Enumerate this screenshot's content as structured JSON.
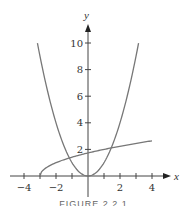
{
  "chart_data": {
    "type": "line",
    "title": "",
    "xlabel": "x",
    "ylabel": "y",
    "xlim": [
      -4.5,
      5
    ],
    "ylim": [
      0,
      11.5
    ],
    "x_ticks": [
      -4,
      -3,
      -2,
      -1,
      1,
      2,
      3,
      4
    ],
    "x_tick_labels": [
      "-4",
      "-2",
      "2",
      "4"
    ],
    "x_tick_label_values": [
      -4,
      -2,
      2,
      4
    ],
    "y_ticks": [
      2,
      4,
      6,
      8,
      10
    ],
    "y_tick_labels": [
      "2",
      "4",
      "6",
      "8",
      "10"
    ],
    "grid": false,
    "legend": null,
    "series": [
      {
        "name": "y = x^2",
        "domain": [
          -3.16,
          3.16
        ],
        "x": [
          -3.16,
          -3,
          -2,
          -1,
          0,
          1,
          2,
          3,
          3.16
        ],
        "values": [
          10,
          9,
          4,
          1,
          0,
          1,
          4,
          9,
          10
        ]
      },
      {
        "name": "y = sqrt(x + 3)",
        "domain": [
          -3,
          4
        ],
        "x": [
          -3,
          -2,
          -1,
          0,
          1,
          2,
          3,
          4
        ],
        "values": [
          0,
          1,
          1.41,
          1.73,
          2,
          2.24,
          2.45,
          2.65
        ]
      }
    ],
    "annotations": []
  },
  "caption": "FIGURE 2.2.1",
  "colors": {
    "curve": "#777777",
    "axis": "#444444",
    "text": "#333333"
  }
}
